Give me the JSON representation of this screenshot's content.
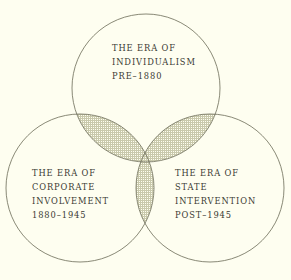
{
  "figure": {
    "type": "venn-diagram",
    "background_color": "#fefef0",
    "stroke_color": "#6b6b57",
    "text_color": "#3a3a32",
    "shading_color": "#b9b99a",
    "shading_style": "fine-cross-hatch-stipple",
    "circle_count": 3
  },
  "sets": {
    "top": {
      "id": "individualism",
      "line1": "THE ERA OF",
      "line2": "INDIVIDUALISM",
      "line3": "PRE–1880",
      "period": "PRE–1880",
      "center": {
        "cx": 146,
        "cy": 88
      },
      "radius": 74
    },
    "left": {
      "id": "corporate-involvement",
      "line1": "THE ERA OF",
      "line2": "CORPORATE",
      "line3": "INVOLVEMENT",
      "line4": "1880–1945",
      "period": "1880–1945",
      "center": {
        "cx": 80,
        "cy": 188
      },
      "radius": 74
    },
    "right": {
      "id": "state-intervention",
      "line1": "THE ERA OF",
      "line2": "STATE",
      "line3": "INTERVENTION",
      "line4": "POST–1945",
      "period": "POST–1945",
      "center": {
        "cx": 210,
        "cy": 188
      },
      "radius": 74
    }
  },
  "intersections": {
    "top_left": {
      "shaded": true,
      "sets": [
        "individualism",
        "corporate-involvement"
      ]
    },
    "top_right": {
      "shaded": true,
      "sets": [
        "individualism",
        "state-intervention"
      ]
    },
    "left_right": {
      "shaded": true,
      "sets": [
        "corporate-involvement",
        "state-intervention"
      ]
    },
    "center_all": {
      "shaded": true,
      "sets": [
        "individualism",
        "corporate-involvement",
        "state-intervention"
      ]
    }
  }
}
